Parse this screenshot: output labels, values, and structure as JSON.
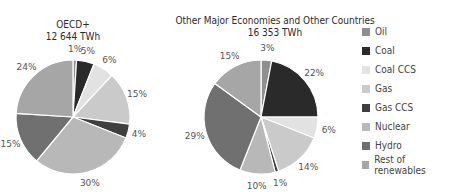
{
  "chart_data": [
    {
      "type": "pie",
      "title": "OECD+",
      "subtitle": "12 644 TWh",
      "categories": [
        "Oil",
        "Coal",
        "Coal CCS",
        "Gas",
        "Gas CCS",
        "Nuclear",
        "Hydro",
        "Rest of renewables"
      ],
      "values": [
        1,
        5,
        6,
        15,
        4,
        30,
        15,
        24
      ],
      "unit": "%"
    },
    {
      "type": "pie",
      "title": "Other Major Economies and Other Countries",
      "subtitle": "16 353 TWh",
      "categories": [
        "Oil",
        "Coal",
        "Coal CCS",
        "Gas",
        "Gas CCS",
        "Nuclear",
        "Hydro",
        "Rest of renewables"
      ],
      "values": [
        3,
        22,
        6,
        14,
        1,
        10,
        29,
        15
      ],
      "unit": "%"
    }
  ],
  "legend": {
    "position": "right",
    "items": [
      {
        "label": "Oil",
        "color": "#8f8f8f"
      },
      {
        "label": "Coal",
        "color": "#2a2a2a"
      },
      {
        "label": "Coal CCS",
        "color": "#e2e2e2"
      },
      {
        "label": "Gas",
        "color": "#cacaca"
      },
      {
        "label": "Gas CCS",
        "color": "#3f3f3f"
      },
      {
        "label": "Nuclear",
        "color": "#b8b8b8"
      },
      {
        "label": "Hydro",
        "color": "#707070"
      },
      {
        "label": "Rest of renewables",
        "color": "#a6a6a6"
      }
    ]
  },
  "pie1": {
    "title": "OECD+",
    "subtitle": "12 644 TWh"
  },
  "pie2": {
    "title": "Other Major Economies and Other Countries",
    "subtitle": "16 353 TWh"
  }
}
